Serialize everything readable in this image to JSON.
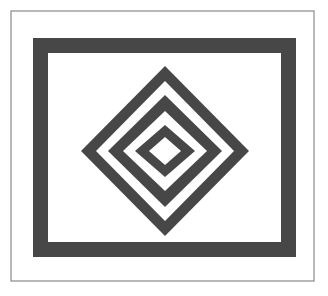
{
  "artwork": {
    "title": "Concentric Diamond Pattern",
    "canvas": {
      "width": 328,
      "height": 296,
      "background_color": "#ffffff"
    },
    "palette": {
      "ink": "#474747",
      "paper": "#ffffff",
      "hairline": "#8a8a8a"
    },
    "outer_border": {
      "name": "thin hairline rectangle",
      "x": 11,
      "y": 11,
      "width": 303,
      "height": 270,
      "stroke_color": "#8a8a8a",
      "stroke_width": 1.2,
      "fill": "none"
    },
    "inner_frame": {
      "name": "thick dark rectangular frame",
      "x": 33,
      "y": 38,
      "width": 263,
      "height": 219,
      "band_thickness": 15,
      "color": "#474747"
    },
    "diamond_stack": {
      "name": "nested concentric diamonds",
      "center_x": 165,
      "center_y": 151,
      "color": "#474747",
      "background_color": "#ffffff",
      "ring_count": 3,
      "rings": [
        {
          "index": 1,
          "role": "outer dark ring",
          "half_width": 84,
          "half_height": 85,
          "fill": "#474747"
        },
        {
          "index": 2,
          "role": "white gap",
          "half_width": 69,
          "half_height": 70,
          "fill": "#ffffff"
        },
        {
          "index": 3,
          "role": "middle dark ring",
          "half_width": 57,
          "half_height": 56,
          "fill": "#474747"
        },
        {
          "index": 4,
          "role": "white gap",
          "half_width": 42,
          "half_height": 40,
          "fill": "#ffffff"
        },
        {
          "index": 5,
          "role": "inner dark ring",
          "half_width": 30,
          "half_height": 26,
          "fill": "#474747"
        },
        {
          "index": 6,
          "role": "white gap",
          "half_width": 16,
          "half_height": 14,
          "fill": "#ffffff"
        },
        {
          "index": 7,
          "role": "solid core diamond",
          "half_width": 0,
          "half_height": 0,
          "fill": "#474747"
        }
      ],
      "core": {
        "role": "center dark diamond",
        "half_width": 29,
        "half_height": 27,
        "fill": "#474747"
      }
    }
  }
}
